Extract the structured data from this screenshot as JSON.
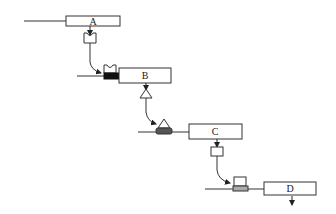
{
  "diagram": {
    "type": "process-flow",
    "colors": {
      "stroke": "#333333",
      "background": "#ffffff",
      "block_black": "#111111",
      "block_dark_gray": "#555555",
      "block_light_gray": "#aaaaaa"
    },
    "stages": [
      {
        "id": "A",
        "label": "A",
        "output_token": "u-notch-container"
      },
      {
        "id": "B",
        "label": "B",
        "input_token": "u-notch-on-black-block",
        "output_token": "triangle"
      },
      {
        "id": "C",
        "label": "C",
        "input_token": "triangle-on-gray-block",
        "output_token": "small-rectangle"
      },
      {
        "id": "D",
        "label": "D",
        "input_token": "rectangle-on-light-gray-block",
        "output_token": "arrow-down"
      }
    ]
  }
}
